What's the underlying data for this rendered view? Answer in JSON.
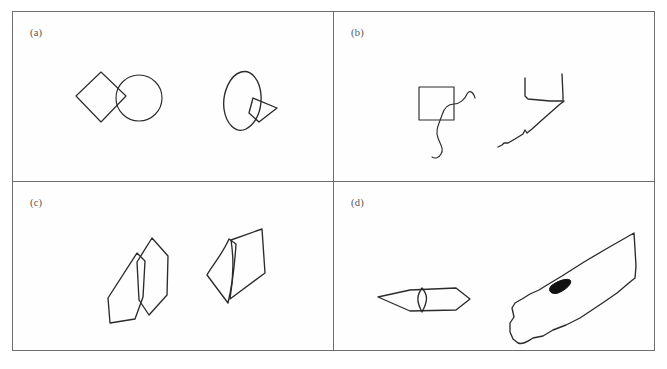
{
  "figure": {
    "background_color": "#ffffff",
    "frame_color": "#6e6e6e",
    "ink_color": "#2b2b2b",
    "blob_color": "#111111",
    "panel_count": 4,
    "panels": [
      {
        "id": "a",
        "label": "(a)",
        "position": "top-left",
        "shapes": [
          {
            "name": "diamond-circle-pair",
            "side": "left",
            "style": "clean-geometric",
            "parts": [
              "diamond",
              "circle"
            ],
            "description": "A square rotated 45 degrees (diamond) whose right vertex overlaps the left side of a circle"
          },
          {
            "name": "ellipse-kite-pair",
            "side": "right",
            "style": "hand-drawn",
            "parts": [
              "tilted-ellipse",
              "small-kite"
            ],
            "description": "A tilted hand-drawn ellipse with a small arrow-like kite shape overlapping its lower right edge"
          }
        ]
      },
      {
        "id": "b",
        "label": "(b)",
        "position": "top-right",
        "shapes": [
          {
            "name": "square-squiggle-pair",
            "side": "left",
            "style": "clean-geometric",
            "parts": [
              "square",
              "s-curve-squiggle"
            ],
            "description": "An axis-aligned square with a long S shaped wavy line crossing its lower right corner"
          },
          {
            "name": "u-shape-diagonal-pair",
            "side": "right",
            "style": "hand-drawn",
            "parts": [
              "open-square",
              "diagonal-squiggle"
            ],
            "description": "A hand drawn U shaped open square with a kinked diagonal line running down to the lower left"
          }
        ]
      },
      {
        "id": "c",
        "label": "(c)",
        "position": "bottom-left",
        "shapes": [
          {
            "name": "overlapping-petals",
            "side": "left",
            "style": "hand-drawn",
            "parts": [
              "petal-polygon-left",
              "petal-polygon-right"
            ],
            "description": "Two elongated hexagonal petal polygons overlapping and tilted toward each other"
          },
          {
            "name": "folded-quadrilaterals",
            "side": "right",
            "style": "hand-drawn",
            "parts": [
              "quadrilateral-left",
              "quadrilateral-right"
            ],
            "description": "Two adjoining quadrilaterals sharing a slightly curved common edge, like a folded page"
          }
        ]
      },
      {
        "id": "d",
        "label": "(d)",
        "position": "bottom-right",
        "shapes": [
          {
            "name": "flat-hexagon-with-diamond",
            "side": "left",
            "style": "hand-drawn",
            "parts": [
              "elongated-flat-hexagon",
              "inner-diamond"
            ],
            "description": "A wide flat elongated hexagon with a small vertical diamond drawn at its center"
          },
          {
            "name": "blade-polygon-with-blob",
            "side": "right",
            "style": "hand-drawn",
            "parts": [
              "irregular-blade-polygon",
              "filled-black-blob"
            ],
            "description": "A large irregular blade shaped polygon angled from lower left to upper right containing a small solid black almond shaped blob"
          }
        ]
      }
    ]
  }
}
